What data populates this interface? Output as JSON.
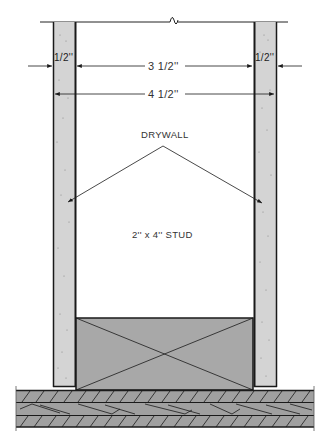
{
  "diagram": {
    "type": "wall-section",
    "labels": {
      "drywall": "DRYWALL",
      "stud": "2'' x 4'' STUD",
      "left_drywall_thickness": "1/2''",
      "right_drywall_thickness": "1/2''",
      "stud_depth": "3 1/2''",
      "total_depth": "4 1/2''"
    },
    "colors": {
      "line": "#1a1a1a",
      "drywall_fill": "#d4d4d4",
      "stud_fill": "#a8a8a8",
      "plate_fill": "#a0a0a0",
      "background": "#ffffff"
    },
    "components": [
      {
        "name": "left-drywall",
        "material": "drywall"
      },
      {
        "name": "right-drywall",
        "material": "drywall"
      },
      {
        "name": "stud-end",
        "material": "wood",
        "symbol": "cross"
      },
      {
        "name": "bottom-plate",
        "material": "wood",
        "symbol": "grain-hatch"
      }
    ]
  }
}
